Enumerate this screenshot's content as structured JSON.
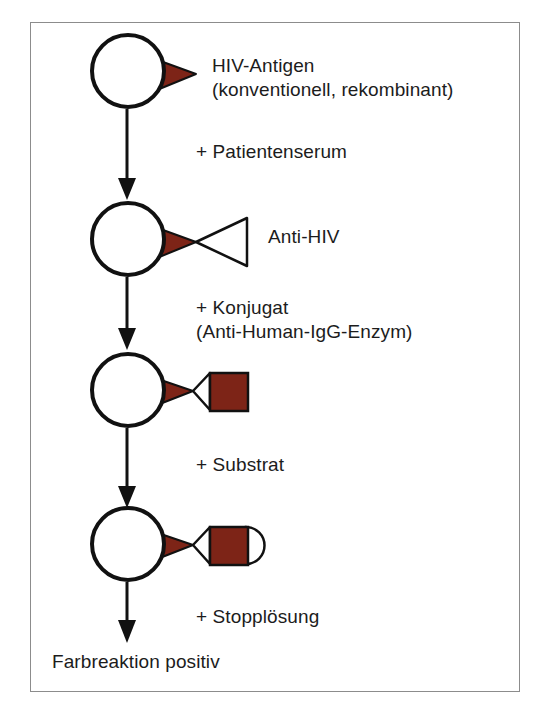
{
  "figure": {
    "language": "de",
    "border_color": "#8c8c8c",
    "background": "#ffffff"
  },
  "colors": {
    "antigen_red": "#7d2417",
    "enzyme_red": "#7d2417",
    "outline_black": "#111111",
    "text": "#1c1c1c",
    "white": "#ffffff"
  },
  "steps": [
    {
      "id": "step-1",
      "label_line1": "HIV-Antigen",
      "label_line2": "(konventionell, rekombinant)",
      "shapes": [
        "solid-phase-circle",
        "antigen-triangle"
      ]
    },
    {
      "id": "step-2",
      "label_line1": "Anti-HIV",
      "label_line2": "",
      "shapes": [
        "solid-phase-circle",
        "antigen-triangle",
        "antibody-triangle"
      ]
    },
    {
      "id": "step-3",
      "label_line1": "",
      "label_line2": "",
      "shapes": [
        "solid-phase-circle",
        "antigen-triangle",
        "antibody-triangle",
        "enzyme-square"
      ]
    },
    {
      "id": "step-4",
      "label_line1": "",
      "label_line2": "",
      "shapes": [
        "solid-phase-circle",
        "antigen-triangle",
        "antibody-triangle",
        "enzyme-square",
        "substrate-semicircle"
      ]
    }
  ],
  "reagents": [
    {
      "id": "reagent-1",
      "line1": "+ Patientenserum",
      "line2": ""
    },
    {
      "id": "reagent-2",
      "line1": "+ Konjugat",
      "line2": "(Anti-Human-IgG-Enzym)"
    },
    {
      "id": "reagent-3",
      "line1": "+ Substrat",
      "line2": ""
    },
    {
      "id": "reagent-4",
      "line1": "+ Stopplösung",
      "line2": ""
    }
  ],
  "result": {
    "label": "Farbreaktion positiv"
  },
  "arrows": [
    {
      "id": "arrow-1",
      "from": "step-1",
      "to": "step-2"
    },
    {
      "id": "arrow-2",
      "from": "step-2",
      "to": "step-3"
    },
    {
      "id": "arrow-3",
      "from": "step-3",
      "to": "step-4"
    },
    {
      "id": "arrow-4",
      "from": "step-4",
      "to": "result"
    }
  ]
}
